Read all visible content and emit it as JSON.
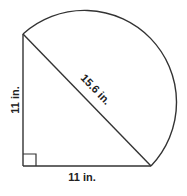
{
  "figure": {
    "labels": {
      "left_leg": "11 in.",
      "bottom_leg": "11 in.",
      "hypotenuse": "15.6 in."
    },
    "measurements": {
      "left_leg_in": 11,
      "bottom_leg_in": 11,
      "hypotenuse_in": 15.6
    },
    "right_angle_marker": true,
    "stroke_color": "#333333"
  }
}
